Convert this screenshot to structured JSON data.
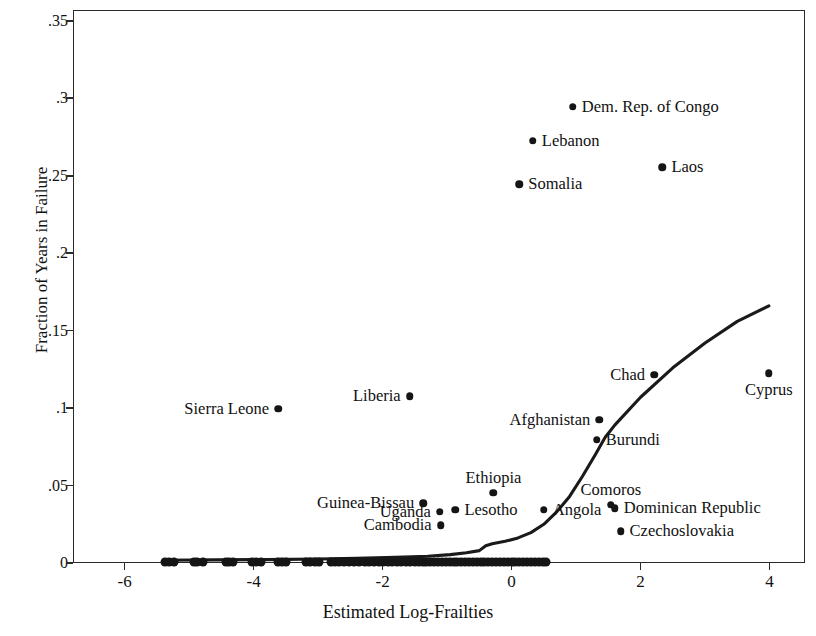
{
  "chart_data": {
    "type": "scatter",
    "title": "",
    "xlabel": "Estimated Log-Frailties",
    "ylabel": "Fraction of Years in Failure",
    "xlim": [
      -6.8,
      4.55
    ],
    "ylim": [
      0,
      0.357
    ],
    "xticks": [
      "-6",
      "-4",
      "-2",
      "0",
      "2",
      "4"
    ],
    "xtick_values": [
      -6,
      -4,
      -2,
      0,
      2,
      4
    ],
    "yticks": [
      "0",
      ".05",
      ".1",
      ".15",
      ".2",
      ".25",
      ".3",
      ".35"
    ],
    "ytick_values": [
      0,
      0.05,
      0.1,
      0.15,
      0.2,
      0.25,
      0.3,
      0.35
    ],
    "grid": false,
    "legend": null,
    "marker_color": "#151515",
    "line_color": "#1a1a1a",
    "labeled_points": [
      {
        "name": "Dem. Rep. of Congo",
        "x": 0.95,
        "y": 0.2945,
        "label_pos": "right"
      },
      {
        "name": "Lebanon",
        "x": 0.33,
        "y": 0.2725,
        "label_pos": "right"
      },
      {
        "name": "Laos",
        "x": 2.34,
        "y": 0.2555,
        "label_pos": "right"
      },
      {
        "name": "Somalia",
        "x": 0.12,
        "y": 0.2445,
        "label_pos": "right"
      },
      {
        "name": "Chad",
        "x": 2.21,
        "y": 0.1215,
        "label_pos": "left"
      },
      {
        "name": "Cyprus",
        "x": 3.99,
        "y": 0.1225,
        "label_pos": "below"
      },
      {
        "name": "Liberia",
        "x": -1.58,
        "y": 0.1075,
        "label_pos": "left"
      },
      {
        "name": "Sierra Leone",
        "x": -3.62,
        "y": 0.0995,
        "label_pos": "left"
      },
      {
        "name": "Afghanistan",
        "x": 1.36,
        "y": 0.0925,
        "label_pos": "left"
      },
      {
        "name": "Burundi",
        "x": 1.32,
        "y": 0.0795,
        "label_pos": "right"
      },
      {
        "name": "Ethiopia",
        "x": -0.28,
        "y": 0.0455,
        "label_pos": "above"
      },
      {
        "name": "Guinea-Bissau",
        "x": -1.37,
        "y": 0.0385,
        "label_pos": "left"
      },
      {
        "name": "Comoros",
        "x": 1.54,
        "y": 0.0377,
        "label_pos": "above"
      },
      {
        "name": "Dominican Republic",
        "x": 1.6,
        "y": 0.0355,
        "label_pos": "right"
      },
      {
        "name": "Angola",
        "x": 0.5,
        "y": 0.0345,
        "label_pos": "right"
      },
      {
        "name": "Lesotho",
        "x": -0.87,
        "y": 0.0345,
        "label_pos": "right"
      },
      {
        "name": "Uganda",
        "x": -1.11,
        "y": 0.0332,
        "label_pos": "left"
      },
      {
        "name": "Cambodia",
        "x": -1.1,
        "y": 0.0245,
        "label_pos": "left"
      },
      {
        "name": "Czechoslovakia",
        "x": 1.69,
        "y": 0.0205,
        "label_pos": "right"
      }
    ],
    "zero_line_points_x": [
      -5.37,
      -5.31,
      -5.24,
      -4.93,
      -4.87,
      -4.78,
      -4.43,
      -4.38,
      -4.32,
      -4.02,
      -3.96,
      -3.88,
      -3.62,
      -3.56,
      -3.5,
      -3.18,
      -3.12,
      -3.05,
      -2.98,
      -2.8,
      -2.74,
      -2.67,
      -2.6,
      -2.52,
      -2.44,
      -2.36,
      -2.28,
      -2.21,
      -2.14,
      -2.06,
      -1.99,
      -1.92,
      -1.85,
      -1.78,
      -1.71,
      -1.64,
      -1.57,
      -1.5,
      -1.44,
      -1.38,
      -1.32,
      -1.26,
      -1.2,
      -1.14,
      -1.08,
      -1.02,
      -0.96,
      -0.9,
      -0.84,
      -0.78,
      -0.72,
      -0.66,
      -0.6,
      -0.54,
      -0.48,
      -0.42,
      -0.36,
      -0.3,
      -0.24,
      -0.18,
      -0.12,
      -0.06,
      0.0,
      0.06,
      0.12,
      0.18,
      0.24,
      0.3,
      0.36,
      0.42,
      0.48,
      0.54
    ],
    "zero_line_y": 0.0,
    "trend_line": [
      [
        -5.4,
        0.0018
      ],
      [
        -4.6,
        0.002
      ],
      [
        -3.8,
        0.0022
      ],
      [
        -3.0,
        0.0026
      ],
      [
        -2.4,
        0.003
      ],
      [
        -1.8,
        0.0036
      ],
      [
        -1.3,
        0.0044
      ],
      [
        -0.95,
        0.0054
      ],
      [
        -0.7,
        0.0066
      ],
      [
        -0.5,
        0.008
      ],
      [
        -0.4,
        0.0112
      ],
      [
        -0.3,
        0.0124
      ],
      [
        -0.1,
        0.014
      ],
      [
        0.1,
        0.0162
      ],
      [
        0.3,
        0.0196
      ],
      [
        0.5,
        0.025
      ],
      [
        0.7,
        0.033
      ],
      [
        0.9,
        0.043
      ],
      [
        1.1,
        0.056
      ],
      [
        1.3,
        0.07
      ],
      [
        1.45,
        0.081
      ],
      [
        1.6,
        0.089
      ],
      [
        2.0,
        0.107
      ],
      [
        2.5,
        0.126
      ],
      [
        3.0,
        0.142
      ],
      [
        3.5,
        0.156
      ],
      [
        3.99,
        0.166
      ]
    ]
  }
}
